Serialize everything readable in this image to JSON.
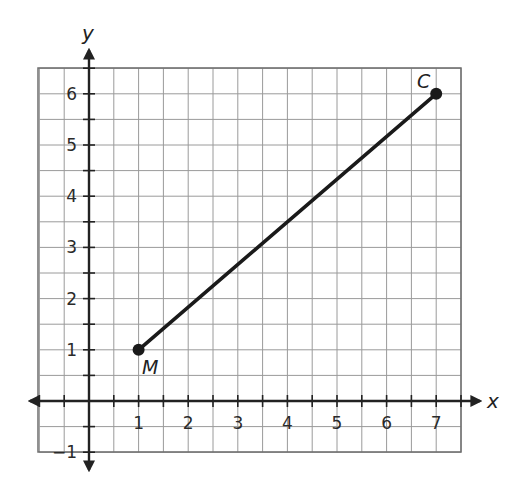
{
  "chart_data": {
    "type": "line",
    "title": "",
    "xlabel": "x",
    "ylabel": "y",
    "xlim": [
      -1,
      7.5
    ],
    "ylim": [
      -1,
      6.5
    ],
    "grid": true,
    "grid_step": 0.5,
    "x_ticks": [
      1,
      2,
      3,
      4,
      5,
      6,
      7
    ],
    "y_ticks": [
      -1,
      1,
      2,
      3,
      4,
      5,
      6
    ],
    "x_tick_labels": [
      "1",
      "2",
      "3",
      "4",
      "5",
      "6",
      "7"
    ],
    "y_tick_labels": [
      "−1",
      "1",
      "2",
      "3",
      "4",
      "5",
      "6"
    ],
    "series": [
      {
        "name": "segment MC",
        "points": [
          {
            "label": "M",
            "x": 1,
            "y": 1
          },
          {
            "label": "C",
            "x": 7,
            "y": 6
          }
        ]
      }
    ],
    "legend": null
  },
  "labels": {
    "x_axis": "x",
    "y_axis": "y",
    "point_m": "M",
    "point_c": "C"
  },
  "colors": {
    "line": "#1a1a1a",
    "grid": "#9a9a9a",
    "axis": "#222222"
  }
}
